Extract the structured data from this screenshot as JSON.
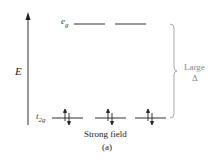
{
  "diagram": {
    "axis_label": "E",
    "upper_level": {
      "label_main": "e",
      "label_sub": "g",
      "orbital_count": 2,
      "electrons": []
    },
    "lower_level": {
      "label_main": "t",
      "label_sub": "2g",
      "orbital_count": 3,
      "electrons": [
        "↑↓",
        "↑↓",
        "↑↓"
      ]
    },
    "splitting_label": "Large",
    "splitting_symbol": "Δ",
    "caption": "Strong field",
    "panel": "(a)",
    "colors": {
      "lines": "#333333",
      "brace": "#aaaaaa",
      "splitting_text": "#888888"
    }
  }
}
